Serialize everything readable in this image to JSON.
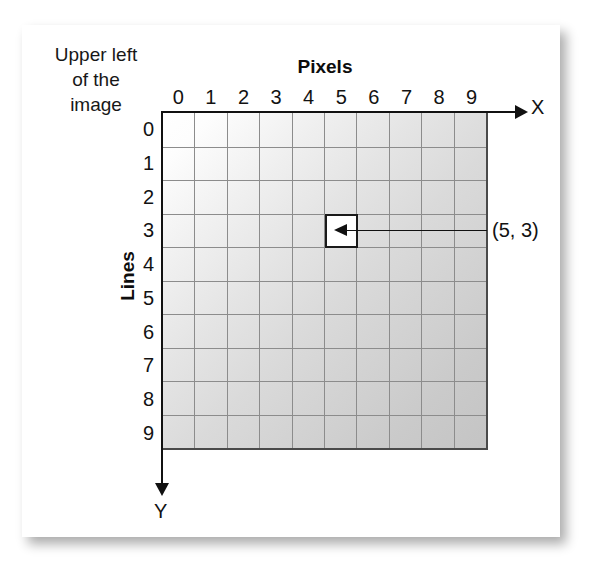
{
  "figure": {
    "upper_left_label": "Upper left\nof the\nimage",
    "pixels_title": "Pixels",
    "lines_title": "Lines",
    "x_axis_label": "X",
    "y_axis_label": "Y",
    "callout_label": "(5, 3)"
  },
  "axes": {
    "column_labels": [
      "0",
      "1",
      "2",
      "3",
      "4",
      "5",
      "6",
      "7",
      "8",
      "9"
    ],
    "row_labels": [
      "0",
      "1",
      "2",
      "3",
      "4",
      "5",
      "6",
      "7",
      "8",
      "9"
    ]
  },
  "grid": {
    "columns": 10,
    "rows": 10,
    "highlighted_cell": {
      "x": 5,
      "y": 3,
      "label": "(5, 3)"
    }
  },
  "colors": {
    "card_background": "#ffffff",
    "grid_line": "#8c8c8c",
    "grid_border": "#4a4a4a",
    "axis": "#111111",
    "text": "#121212",
    "highlight_fill": "#ffffff",
    "highlight_border": "#1a1a1a",
    "gradient_start": "#ffffff",
    "gradient_end": "#c4c4c4"
  }
}
